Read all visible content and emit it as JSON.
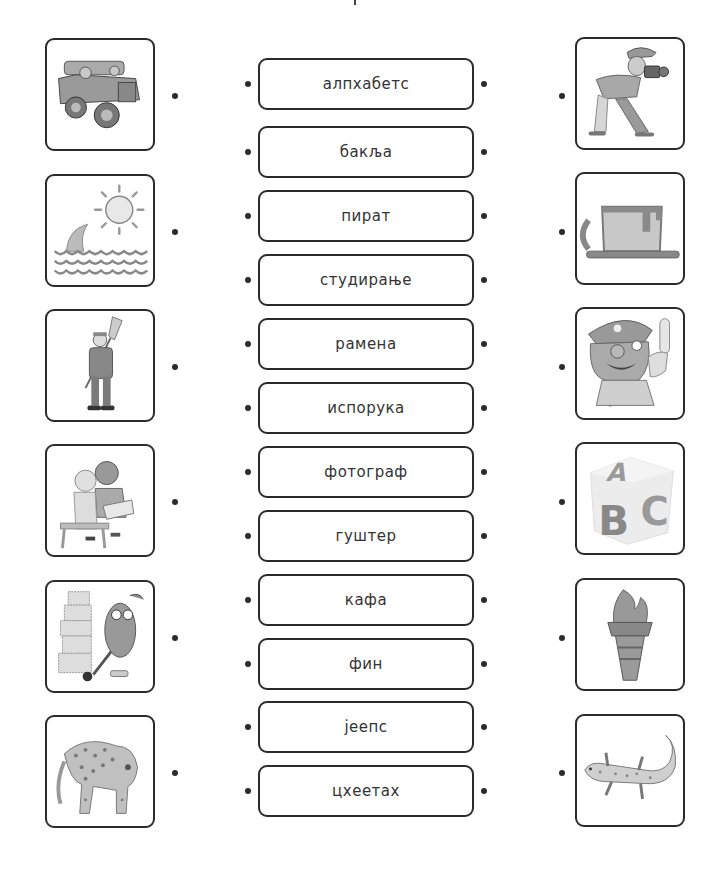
{
  "worksheet": {
    "type": "match-pictures-to-words",
    "left_images": [
      {
        "name": "jeep-icon",
        "depicts": "jeep"
      },
      {
        "name": "shark-fin-icon",
        "depicts": "shark fin in sea with sun"
      },
      {
        "name": "janitor-icon",
        "depicts": "worker with broom"
      },
      {
        "name": "children-reading-icon",
        "depicts": "children studying book"
      },
      {
        "name": "delivery-man-icon",
        "depicts": "delivery man with boxes"
      },
      {
        "name": "cheetah-icon",
        "depicts": "cheetah"
      }
    ],
    "words": [
      {
        "label": "алпхабетс"
      },
      {
        "label": "бакља"
      },
      {
        "label": "пират"
      },
      {
        "label": "студирање"
      },
      {
        "label": "рамена"
      },
      {
        "label": "испорука"
      },
      {
        "label": "фотограф"
      },
      {
        "label": "гуштер"
      },
      {
        "label": "кафа"
      },
      {
        "label": "фин"
      },
      {
        "label": "јеепс"
      },
      {
        "label": "цхеетах"
      }
    ],
    "right_images": [
      {
        "name": "photographer-icon",
        "depicts": "photographer with camera"
      },
      {
        "name": "coffee-cup-icon",
        "depicts": "cup of coffee"
      },
      {
        "name": "pirate-icon",
        "depicts": "pirate"
      },
      {
        "name": "abc-block-icon",
        "depicts": "ABC alphabet block"
      },
      {
        "name": "torch-icon",
        "depicts": "torch"
      },
      {
        "name": "lizard-icon",
        "depicts": "lizard / gecko"
      }
    ],
    "colors": {
      "border": "#2b2b2b",
      "text": "#333333",
      "illustration": "#9a9a9a"
    }
  }
}
